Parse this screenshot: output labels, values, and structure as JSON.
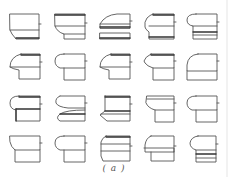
{
  "figure": {
    "caption": "( a )",
    "rows": 4,
    "columns": 5,
    "stroke_color": "#555555",
    "background": "#ffffff",
    "cells": [
      {
        "row": 0,
        "col": 0,
        "x": 7,
        "y": 12,
        "shape": "plain-box-chamfer"
      },
      {
        "row": 0,
        "col": 1,
        "x": 52,
        "y": 12,
        "shape": "box-step-bottom"
      },
      {
        "row": 0,
        "col": 2,
        "x": 97,
        "y": 12,
        "shape": "flat-lip-gap"
      },
      {
        "row": 0,
        "col": 3,
        "x": 141,
        "y": 12,
        "shape": "round-cap-neck"
      },
      {
        "row": 0,
        "col": 4,
        "x": 184,
        "y": 12,
        "shape": "round-cap-bands"
      },
      {
        "row": 1,
        "col": 0,
        "x": 7,
        "y": 52,
        "shape": "round-drip-base"
      },
      {
        "row": 1,
        "col": 1,
        "x": 52,
        "y": 52,
        "shape": "round-cap-base"
      },
      {
        "row": 1,
        "col": 2,
        "x": 97,
        "y": 52,
        "shape": "round-drip-base"
      },
      {
        "row": 1,
        "col": 3,
        "x": 141,
        "y": 52,
        "shape": "pointed-cap-base"
      },
      {
        "row": 1,
        "col": 4,
        "x": 184,
        "y": 52,
        "shape": "quarter-round-base"
      },
      {
        "row": 2,
        "col": 0,
        "x": 7,
        "y": 94,
        "shape": "round-cap-neck-dark"
      },
      {
        "row": 2,
        "col": 1,
        "x": 52,
        "y": 94,
        "shape": "double-lip"
      },
      {
        "row": 2,
        "col": 2,
        "x": 97,
        "y": 94,
        "shape": "slant-lip"
      },
      {
        "row": 2,
        "col": 3,
        "x": 141,
        "y": 94,
        "shape": "cove-base"
      },
      {
        "row": 2,
        "col": 4,
        "x": 184,
        "y": 94,
        "shape": "round-cap-base"
      },
      {
        "row": 3,
        "col": 0,
        "x": 7,
        "y": 134,
        "shape": "plain-base"
      },
      {
        "row": 3,
        "col": 1,
        "x": 52,
        "y": 134,
        "shape": "round-cap-base"
      },
      {
        "row": 3,
        "col": 2,
        "x": 97,
        "y": 134,
        "shape": "bevel-box"
      },
      {
        "row": 3,
        "col": 3,
        "x": 141,
        "y": 134,
        "shape": "lip-band-base"
      },
      {
        "row": 3,
        "col": 4,
        "x": 184,
        "y": 134,
        "shape": "round-bands-small"
      }
    ]
  }
}
